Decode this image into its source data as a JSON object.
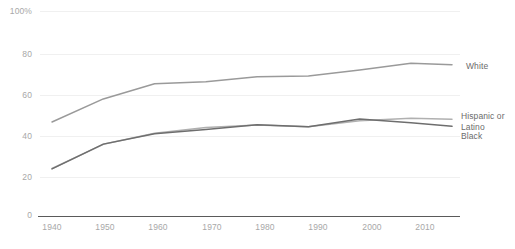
{
  "chart_data": {
    "type": "line",
    "title": "",
    "subtitle": "",
    "xlabel": "",
    "ylabel": "",
    "xlim": [
      1940,
      2018
    ],
    "ylim": [
      0,
      100
    ],
    "grid": true,
    "legend_position": "right-inline",
    "y_ticks": [
      "0",
      "20",
      "40",
      "60",
      "80",
      "100%"
    ],
    "y_tick_values": [
      0,
      20,
      40,
      60,
      80,
      100
    ],
    "x_ticks": [
      "1940",
      "1950",
      "1960",
      "1970",
      "1980",
      "1990",
      "2000",
      "2010"
    ],
    "x_tick_values": [
      1940,
      1950,
      1960,
      1970,
      1980,
      1990,
      2000,
      2010
    ],
    "x": [
      1940,
      1950,
      1960,
      1970,
      1980,
      1990,
      2000,
      2010,
      2018
    ],
    "series": [
      {
        "name": "White",
        "color": "#9a9a9a",
        "values": [
          45.7,
          57.0,
          64.4,
          65.4,
          67.8,
          68.2,
          71.1,
          74.4,
          73.7
        ]
      },
      {
        "name": "Hispanic or Latino",
        "color": "#b0b0b0",
        "values": [
          23.0,
          34.8,
          40.2,
          43.0,
          44.2,
          43.4,
          46.3,
          47.5,
          47.1
        ]
      },
      {
        "name": "Black",
        "color": "#6e6e6e",
        "values": [
          22.8,
          34.9,
          40.0,
          42.0,
          44.4,
          43.4,
          47.2,
          45.4,
          43.6
        ]
      }
    ],
    "series_labels": [
      {
        "key": "white",
        "text": "White"
      },
      {
        "key": "hispanic",
        "text": "Hispanic or\nLatino"
      },
      {
        "key": "black",
        "text": "Black"
      }
    ]
  }
}
